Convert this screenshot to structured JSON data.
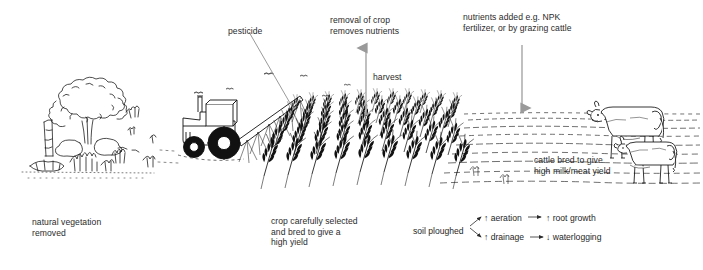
{
  "diagram": {
    "background_color": "#ffffff",
    "ink_color": "#1a1a1a",
    "arrow_color": "#9a9a9a",
    "text_color": "#2b2b2b"
  },
  "labels": {
    "pesticide": "pesticide",
    "removal_of_crop": "removal of crop\nremoves nutrients",
    "harvest": "harvest",
    "nutrients_added": "nutrients added e.g. NPK\nfertilizer, or by grazing cattle",
    "cattle_bred": "cattle bred to give\nhigh milk/meat yield",
    "natural_vegetation": "natural vegetation\nremoved",
    "crop_selected": "crop carefully selected\nand bred to give a\nhigh yield"
  },
  "soil_flow": {
    "source": "soil ploughed",
    "branches": [
      {
        "cause": "↑ aeration",
        "effect": "↑ root growth"
      },
      {
        "cause": "↑ drainage",
        "effect": "↓ waterlogging"
      }
    ]
  },
  "scene": {
    "regions": [
      {
        "name": "natural-vegetation-zone",
        "caption": "tree and scrub being cleared"
      },
      {
        "name": "tractor-spraying-zone",
        "caption": "tractor with spray boom applying pesticide"
      },
      {
        "name": "cereal-crop-zone",
        "caption": "rows of cereal crop"
      },
      {
        "name": "ploughed-pasture-zone",
        "caption": "ploughed field with grazing cattle"
      }
    ],
    "icons": [
      "tree-icon",
      "tractor-icon",
      "spray-boom-icon",
      "wheat-icon",
      "cow-icon",
      "bird-icon"
    ]
  }
}
